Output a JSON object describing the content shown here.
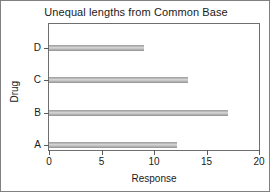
{
  "chart_data": {
    "type": "bar",
    "orientation": "horizontal",
    "title": "Unequal lengths from Common Base",
    "xlabel": "Response",
    "ylabel": "Drug",
    "categories": [
      "A",
      "B",
      "C",
      "D"
    ],
    "values": [
      12.2,
      17.0,
      13.2,
      9.0
    ],
    "display_order_top_to_bottom": [
      "D",
      "C",
      "B",
      "A"
    ],
    "xlim": [
      0,
      20
    ],
    "xticks": [
      0,
      5,
      10,
      15,
      20
    ],
    "xtick_labels": [
      "0",
      "5",
      "10",
      "15",
      "20"
    ],
    "ytick_labels": [
      "D",
      "C",
      "B",
      "A"
    ],
    "grid": false,
    "legend": "none",
    "bar_color": "#a8a8a8",
    "axis_color": "#5a5a5a",
    "text_color": "#1a1a1a",
    "background": "#ffffff"
  }
}
